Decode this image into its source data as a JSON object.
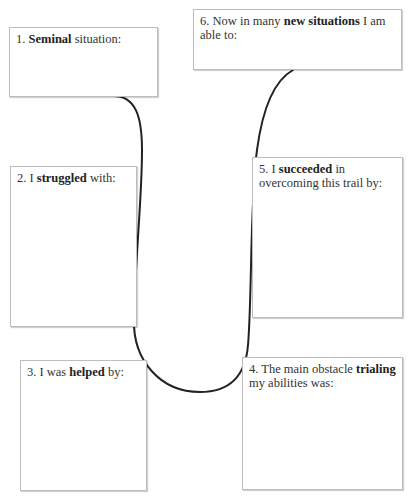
{
  "diagram": {
    "type": "journey-worksheet",
    "connector_color": "#222222",
    "border_color": "#bdbdbd",
    "steps": [
      {
        "number": "1.",
        "pre": "",
        "bold": "Seminal",
        "post": " situation:"
      },
      {
        "number": "2.",
        "pre": "I ",
        "bold": "struggled",
        "post": " with:"
      },
      {
        "number": "3.",
        "pre": "I was ",
        "bold": "helped",
        "post": " by:"
      },
      {
        "number": "4.",
        "pre": "The main obstacle ",
        "bold": "trialing",
        "post": " my abilities was:"
      },
      {
        "number": "5.",
        "pre": "I ",
        "bold": "succeeded",
        "post": " in overcoming this trail by:"
      },
      {
        "number": "6.",
        "pre": "Now in many ",
        "bold": "new situations",
        "post": " I am able to:"
      }
    ]
  }
}
